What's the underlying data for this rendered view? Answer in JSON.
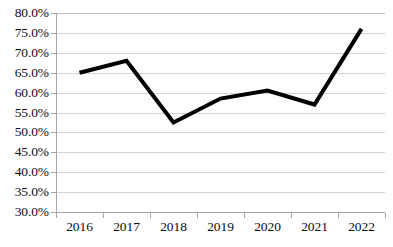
{
  "chart_data": {
    "type": "line",
    "title": "",
    "subtitle": "",
    "xlabel": "",
    "ylabel": "",
    "categories": [
      "2016",
      "2017",
      "2018",
      "2019",
      "2020",
      "2021",
      "2022"
    ],
    "series": [
      {
        "name": "",
        "values": [
          0.65,
          0.68,
          0.525,
          0.585,
          0.605,
          0.57,
          0.76
        ]
      }
    ],
    "y_tick_labels": [
      "80.0%",
      "75.0%",
      "70.0%",
      "65.0%",
      "60.0%",
      "55.0%",
      "50.0%",
      "45.0%",
      "40.0%",
      "35.0%",
      "30.0%"
    ],
    "y_tick_values": [
      0.8,
      0.75,
      0.7,
      0.65,
      0.6,
      0.55,
      0.5,
      0.45,
      0.4,
      0.35,
      0.3
    ],
    "ylim": [
      0.3,
      0.8
    ],
    "y_tick_step": 0.05,
    "grid": true,
    "legend": false,
    "legend_position": "none",
    "annotations": [],
    "colors": {
      "line": "#000000",
      "gridline": "#d3d3d3",
      "axis": "#a6a6a6",
      "text": "#0d0d0d",
      "background": "#ffffff"
    },
    "line_width": 4
  }
}
